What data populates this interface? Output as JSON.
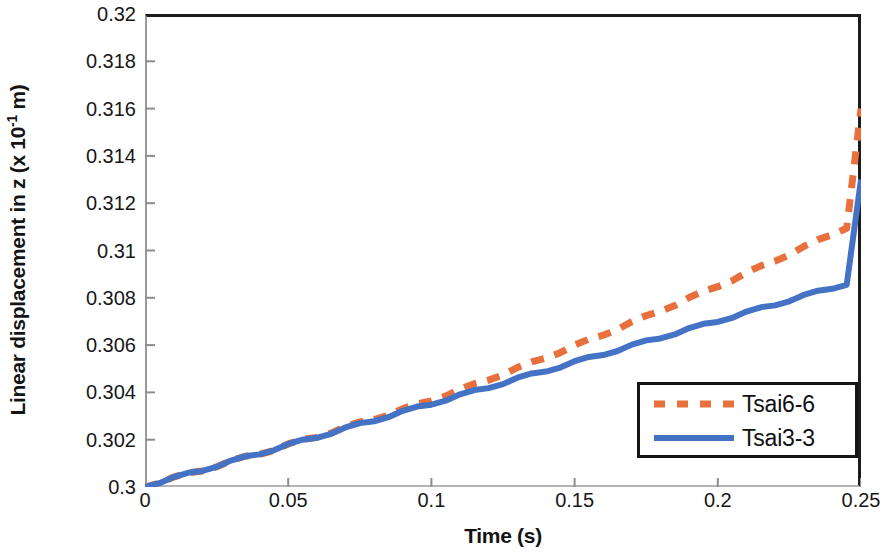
{
  "chart_data": {
    "type": "line",
    "title": "",
    "xlabel": "Time (s)",
    "ylabel_html": "Linear displacement in z (x 10<sup>-1</sup> m)",
    "ylabel": "Linear displacement in z (x 10-1 m)",
    "xlim": [
      0,
      0.25
    ],
    "ylim": [
      0.3,
      0.32
    ],
    "xticks": [
      "0",
      "0.05",
      "0.1",
      "0.15",
      "0.2",
      "0.25"
    ],
    "xtick_values": [
      0,
      0.05,
      0.1,
      0.15,
      0.2,
      0.25
    ],
    "yticks": [
      "0.3",
      "0.302",
      "0.304",
      "0.306",
      "0.308",
      "0.31",
      "0.312",
      "0.314",
      "0.316",
      "0.318",
      "0.32"
    ],
    "ytick_values": [
      0.3,
      0.302,
      0.304,
      0.306,
      0.308,
      0.31,
      0.312,
      0.314,
      0.316,
      0.318,
      0.32
    ],
    "grid": false,
    "legend_position": "lower-right",
    "series": [
      {
        "name": "Tsai6-6",
        "color": "#E8703C",
        "style": "dashed",
        "x": [
          0,
          0.005,
          0.01,
          0.015,
          0.02,
          0.025,
          0.03,
          0.035,
          0.04,
          0.045,
          0.05,
          0.055,
          0.06,
          0.065,
          0.07,
          0.075,
          0.08,
          0.085,
          0.09,
          0.095,
          0.1,
          0.105,
          0.11,
          0.115,
          0.12,
          0.125,
          0.13,
          0.135,
          0.14,
          0.145,
          0.15,
          0.155,
          0.16,
          0.165,
          0.17,
          0.175,
          0.18,
          0.185,
          0.19,
          0.195,
          0.2,
          0.205,
          0.21,
          0.215,
          0.22,
          0.225,
          0.23,
          0.235,
          0.24,
          0.245,
          0.25
        ],
        "y": [
          0.3,
          0.30016,
          0.30042,
          0.3006,
          0.30068,
          0.30085,
          0.30112,
          0.3013,
          0.30138,
          0.30155,
          0.30182,
          0.30201,
          0.3021,
          0.30228,
          0.30256,
          0.30275,
          0.30285,
          0.30303,
          0.30331,
          0.30352,
          0.30364,
          0.30384,
          0.30414,
          0.30437,
          0.30452,
          0.30474,
          0.30505,
          0.30529,
          0.30545,
          0.30568,
          0.306,
          0.30625,
          0.30642,
          0.30666,
          0.30699,
          0.30725,
          0.30743,
          0.30767,
          0.30801,
          0.30828,
          0.30847,
          0.30872,
          0.30907,
          0.30935,
          0.30955,
          0.30981,
          0.31017,
          0.31046,
          0.31067,
          0.31094,
          0.316
        ]
      },
      {
        "name": "Tsai3-3",
        "color": "#4472C4",
        "style": "solid",
        "x": [
          0,
          0.005,
          0.01,
          0.015,
          0.02,
          0.025,
          0.03,
          0.035,
          0.04,
          0.045,
          0.05,
          0.055,
          0.06,
          0.065,
          0.07,
          0.075,
          0.08,
          0.085,
          0.09,
          0.095,
          0.1,
          0.105,
          0.11,
          0.115,
          0.12,
          0.125,
          0.13,
          0.135,
          0.14,
          0.145,
          0.15,
          0.155,
          0.16,
          0.165,
          0.17,
          0.175,
          0.18,
          0.185,
          0.19,
          0.195,
          0.2,
          0.205,
          0.21,
          0.215,
          0.22,
          0.225,
          0.23,
          0.235,
          0.24,
          0.245,
          0.25
        ],
        "y": [
          0.3,
          0.30016,
          0.30042,
          0.3006,
          0.30068,
          0.30085,
          0.30112,
          0.3013,
          0.30138,
          0.30155,
          0.30182,
          0.302,
          0.30208,
          0.30225,
          0.30252,
          0.3027,
          0.30278,
          0.30295,
          0.30322,
          0.3034,
          0.30348,
          0.30365,
          0.30392,
          0.3041,
          0.30418,
          0.30435,
          0.30462,
          0.3048,
          0.30488,
          0.30505,
          0.30532,
          0.3055,
          0.30558,
          0.30575,
          0.30602,
          0.3062,
          0.30628,
          0.30645,
          0.30672,
          0.3069,
          0.30698,
          0.30715,
          0.30742,
          0.3076,
          0.30768,
          0.30785,
          0.30812,
          0.3083,
          0.30838,
          0.30855,
          0.313
        ]
      }
    ]
  },
  "legend": {
    "entries": [
      {
        "label": "Tsai6-6"
      },
      {
        "label": "Tsai3-3"
      }
    ]
  }
}
